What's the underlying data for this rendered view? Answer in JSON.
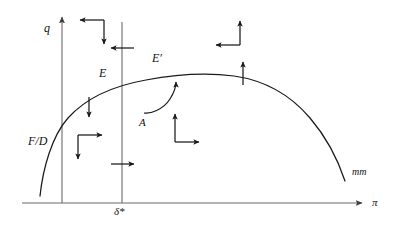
{
  "figure": {
    "type": "phase-plane-diagram",
    "background_color": "#ffffff",
    "stroke_color": "#1a1a1a",
    "axis_color": "#555555",
    "labels": {
      "y_axis": "q",
      "x_axis": "π",
      "vertical_nullcline": "δ*",
      "curve_left_branch": "F/D",
      "region_E": "E",
      "region_E_prime": "E′",
      "point_A": "A",
      "curve_right_end": "mm"
    },
    "axes": {
      "y_axis_label": "q",
      "x_axis_label": "π",
      "x_axis_y_px": 203,
      "y_axis_x_px": 62,
      "y_axis_top_px": 14,
      "x_axis_right_px": 366
    },
    "vertical_line": {
      "name": "δ*",
      "x_px": 122,
      "top_px": 22,
      "bottom_px": 203
    },
    "curve": {
      "name": "mm",
      "shape": "inverted-U hump rising from lower-left, peaking near center, falling to right",
      "peak_x_px": 232,
      "peak_y_px": 76,
      "left_end_x_px": 40,
      "left_end_y_px": 196,
      "right_end_x_px": 345,
      "right_end_y_px": 180
    },
    "direction_arrows": [
      {
        "id": "nw-pair",
        "kind": "corner-pair",
        "horizontal": "left",
        "vertical": "down",
        "corner": "top-right",
        "x_px": 105,
        "y_px": 20,
        "quadrant": "upper-left region"
      },
      {
        "id": "ne-pair",
        "kind": "corner-pair",
        "horizontal": "left",
        "vertical": "up",
        "corner": "bottom-right",
        "x_px": 240,
        "y_px": 45,
        "quadrant": "upper-right region"
      },
      {
        "id": "sw-pair",
        "kind": "corner-pair",
        "horizontal": "right",
        "vertical": "down",
        "corner": "top-left",
        "x_px": 78,
        "y_px": 135,
        "quadrant": "lower-left region"
      },
      {
        "id": "se-pair",
        "kind": "corner-pair",
        "horizontal": "right",
        "vertical": "up",
        "corner": "bottom-left",
        "x_px": 175,
        "y_px": 118,
        "quadrant": "lower-right region near A"
      },
      {
        "id": "tick-left-upper",
        "kind": "single",
        "direction": "left",
        "on": "δ* line",
        "x_px": 122,
        "y_px": 48
      },
      {
        "id": "tick-right-lower",
        "kind": "single",
        "direction": "right",
        "on": "δ* line",
        "x_px": 122,
        "y_px": 164
      },
      {
        "id": "tick-down-curve",
        "kind": "single",
        "direction": "down",
        "on": "mm curve",
        "x_px": 89,
        "y_px": 108
      },
      {
        "id": "tick-up-curve",
        "kind": "single",
        "direction": "up",
        "on": "mm curve",
        "x_px": 243,
        "y_px": 74
      }
    ],
    "trajectory_arc": {
      "id": "saddle-path-arc",
      "from_x_px": 146,
      "from_y_px": 111,
      "to_x_px": 175,
      "to_y_px": 82,
      "label": "A",
      "description": "curved arrow from point A sweeping up-right toward E′ on the mm curve"
    }
  }
}
